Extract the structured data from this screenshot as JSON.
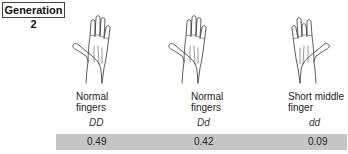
{
  "title": "Generation 2",
  "colors": {
    "frequency_bar": "#c6c6c6",
    "line": "#333333",
    "ring": "#777777"
  },
  "columns": [
    {
      "icon": "hand-normal-fingers-icon",
      "label_line1": "Normal",
      "label_line2": "fingers",
      "genotype": "DD",
      "frequency": "0.49"
    },
    {
      "icon": "hand-normal-fingers-icon",
      "label_line1": "Normal",
      "label_line2": "fingers",
      "genotype": "Dd",
      "frequency": "0.42"
    },
    {
      "icon": "hand-short-middle-finger-icon",
      "label_line1": "Short middle",
      "label_line2": "finger",
      "genotype": "dd",
      "frequency": "0.09"
    }
  ]
}
